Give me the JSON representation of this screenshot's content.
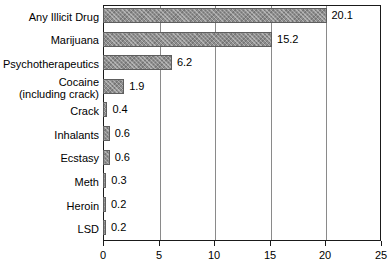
{
  "chart_data": {
    "type": "bar",
    "orientation": "horizontal",
    "title": "",
    "subtitle": "",
    "xlabel": "",
    "ylabel": "",
    "xlim": [
      0,
      25
    ],
    "grid": true,
    "legend": false,
    "xticks": [
      "0",
      "5",
      "10",
      "15",
      "20",
      "25"
    ],
    "xtick_values": [
      0,
      5,
      10,
      15,
      20,
      25
    ],
    "categories": [
      "Any Illicit Drug",
      "Marijuana",
      "Psychotherapeutics",
      "Cocaine (including crack)",
      "Crack",
      "Inhalants",
      "Ecstasy",
      "Meth",
      "Heroin",
      "LSD"
    ],
    "values": [
      20.1,
      15.2,
      6.2,
      1.9,
      0.4,
      0.6,
      0.6,
      0.3,
      0.2,
      0.2
    ],
    "value_labels": [
      "20.1",
      "15.2",
      "6.2",
      "1.9",
      "0.4",
      "0.6",
      "0.6",
      "0.3",
      "0.2",
      "0.2"
    ],
    "bars": [
      {
        "label": "Any Illicit Drug",
        "label_line1": "Any Illicit Drug",
        "label_line2": "",
        "value": 20.1,
        "value_label": "20.1"
      },
      {
        "label": "Marijuana",
        "label_line1": "Marijuana",
        "label_line2": "",
        "value": 15.2,
        "value_label": "15.2"
      },
      {
        "label": "Psychotherapeutics",
        "label_line1": "Psychotherapeutics",
        "label_line2": "",
        "value": 6.2,
        "value_label": "6.2"
      },
      {
        "label": "Cocaine (including crack)",
        "label_line1": "Cocaine",
        "label_line2": "(including crack)",
        "value": 1.9,
        "value_label": "1.9"
      },
      {
        "label": "Crack",
        "label_line1": "Crack",
        "label_line2": "",
        "value": 0.4,
        "value_label": "0.4"
      },
      {
        "label": "Inhalants",
        "label_line1": "Inhalants",
        "label_line2": "",
        "value": 0.6,
        "value_label": "0.6"
      },
      {
        "label": "Ecstasy",
        "label_line1": "Ecstasy",
        "label_line2": "",
        "value": 0.6,
        "value_label": "0.6"
      },
      {
        "label": "Meth",
        "label_line1": "Meth",
        "label_line2": "",
        "value": 0.3,
        "value_label": "0.3"
      },
      {
        "label": "Heroin",
        "label_line1": "Heroin",
        "label_line2": "",
        "value": 0.2,
        "value_label": "0.2"
      },
      {
        "label": "LSD",
        "label_line1": "LSD",
        "label_line2": "",
        "value": 0.2,
        "value_label": "0.2"
      }
    ]
  },
  "colors": {
    "bar_fill": "#8e8e8e",
    "bar_border": "#5e5e5e",
    "axis": "#1a1a1a",
    "gridline": "#8a8a8a",
    "text": "#000000",
    "background": "#ffffff"
  }
}
